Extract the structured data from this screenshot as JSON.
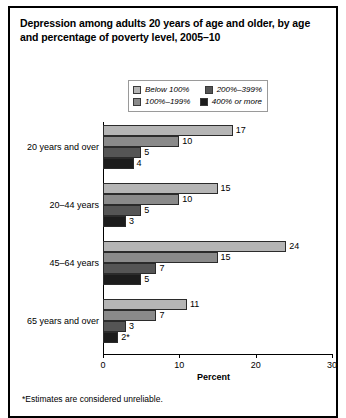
{
  "figure": {
    "title": "Depression among adults 20 years of age and older, by age and percentage of poverty level, 2005–10",
    "footnote": "*Estimates are considered unreliable."
  },
  "legend": {
    "entries": [
      {
        "label": "Below 100%",
        "color": "#b5b5b5"
      },
      {
        "label": "200%–399%",
        "color": "#555555"
      },
      {
        "label": "100%–199%",
        "color": "#8a8a8a"
      },
      {
        "label": "400% or more",
        "color": "#1c1c1c"
      }
    ]
  },
  "chart_data": {
    "type": "bar",
    "orientation": "horizontal",
    "title": "Depression among adults 20 years of age and older, by age and percentage of poverty level, 2005–10",
    "xlabel": "Percent",
    "ylabel": "",
    "xlim": [
      0,
      30
    ],
    "xticks": [
      0,
      10,
      20,
      30
    ],
    "xticklabels": [
      "0",
      "10",
      "20",
      "30"
    ],
    "grid": false,
    "legend_position": "top-center",
    "categories": [
      "20 years and over",
      "20–44 years",
      "45–64 years",
      "65 years and over"
    ],
    "series": [
      {
        "name": "Below 100%",
        "color": "#b5b5b5",
        "values": [
          17,
          15,
          24,
          11
        ],
        "labels": [
          "17",
          "15",
          "24",
          "11"
        ]
      },
      {
        "name": "100%–199%",
        "color": "#8a8a8a",
        "values": [
          10,
          10,
          15,
          7
        ],
        "labels": [
          "10",
          "10",
          "15",
          "7"
        ]
      },
      {
        "name": "200%–399%",
        "color": "#555555",
        "values": [
          5,
          5,
          7,
          3
        ],
        "labels": [
          "5",
          "5",
          "7",
          "3"
        ]
      },
      {
        "name": "400% or more",
        "color": "#1c1c1c",
        "values": [
          4,
          3,
          5,
          2
        ],
        "labels": [
          "4",
          "3",
          "5",
          "2*"
        ]
      }
    ],
    "annotations": [
      "*Estimates are considered unreliable."
    ]
  },
  "axis": {
    "xlabel": "Percent"
  }
}
